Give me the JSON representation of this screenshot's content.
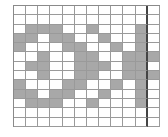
{
  "diagram": {
    "type": "pattern-grid",
    "columns": 12,
    "rows": 13,
    "dashed_divider_after_column": 11,
    "colors": {
      "filled": "#a8a8a8",
      "empty": "#ffffff",
      "grid_line": "#9a9a9a",
      "divider": "#444444"
    },
    "cells": [
      [
        0,
        0,
        0,
        0,
        0,
        0,
        0,
        0,
        0,
        0,
        0,
        0
      ],
      [
        0,
        0,
        0,
        0,
        0,
        0,
        0,
        0,
        0,
        0,
        0,
        0
      ],
      [
        0,
        1,
        1,
        1,
        0,
        0,
        1,
        0,
        0,
        0,
        1,
        0
      ],
      [
        1,
        1,
        0,
        1,
        1,
        0,
        0,
        1,
        0,
        0,
        1,
        0
      ],
      [
        1,
        0,
        0,
        0,
        1,
        1,
        0,
        0,
        1,
        0,
        1,
        0
      ],
      [
        0,
        0,
        1,
        0,
        0,
        1,
        1,
        0,
        0,
        1,
        1,
        1
      ],
      [
        0,
        1,
        1,
        0,
        0,
        1,
        1,
        1,
        0,
        1,
        1,
        0
      ],
      [
        0,
        0,
        1,
        0,
        0,
        1,
        1,
        0,
        0,
        1,
        1,
        1
      ],
      [
        1,
        0,
        0,
        0,
        1,
        1,
        0,
        0,
        1,
        0,
        1,
        0
      ],
      [
        1,
        1,
        0,
        1,
        1,
        0,
        0,
        1,
        0,
        0,
        1,
        0
      ],
      [
        0,
        1,
        1,
        1,
        0,
        0,
        1,
        0,
        0,
        0,
        1,
        0
      ],
      [
        0,
        0,
        0,
        0,
        0,
        0,
        0,
        0,
        0,
        0,
        0,
        0
      ],
      [
        0,
        0,
        0,
        0,
        0,
        0,
        0,
        0,
        0,
        0,
        0,
        0
      ]
    ]
  }
}
